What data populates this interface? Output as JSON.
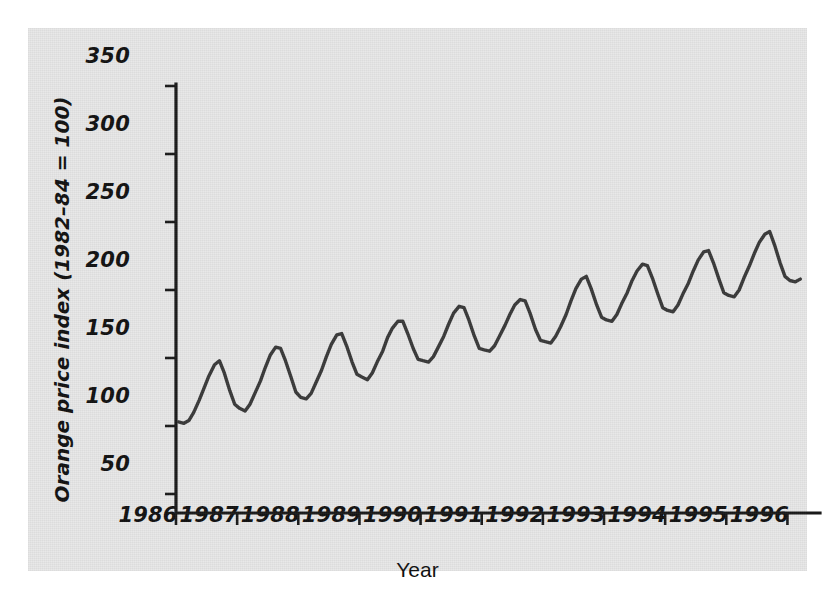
{
  "figure": {
    "background_color": "#e8e8e8",
    "page_color": "#ffffff",
    "line_color": "#3a3a3a",
    "axis_color": "#1a1a1a"
  },
  "chart_data": {
    "type": "line",
    "title": "",
    "subtitle": "",
    "xlabel": "Year",
    "ylabel": "Orange price index (1982–84 = 100)",
    "xlim": [
      1986.0,
      1996.5
    ],
    "ylim": [
      50,
      360
    ],
    "xticks": [
      1986,
      1987,
      1988,
      1989,
      1990,
      1991,
      1992,
      1993,
      1994,
      1995,
      1996
    ],
    "xticklabels": [
      "1986",
      "1987",
      "1988",
      "1989",
      "1990",
      "1991",
      "1992",
      "1993",
      "1994",
      "1995",
      "1996"
    ],
    "yticks": [
      50,
      100,
      150,
      200,
      250,
      300,
      350
    ],
    "yticklabels": [
      "50",
      "100",
      "150",
      "200",
      "250",
      "300",
      "350"
    ],
    "grid": false,
    "legend": null,
    "legend_position": "none",
    "annotations": [],
    "series": [
      {
        "name": "Orange price index",
        "color": "#3a3a3a",
        "x": [
          1986.04,
          1986.13,
          1986.21,
          1986.29,
          1986.38,
          1986.46,
          1986.54,
          1986.63,
          1986.71,
          1986.79,
          1986.88,
          1986.96,
          1987.04,
          1987.13,
          1987.21,
          1987.29,
          1987.38,
          1987.46,
          1987.54,
          1987.63,
          1987.71,
          1987.79,
          1987.88,
          1987.96,
          1988.04,
          1988.13,
          1988.21,
          1988.29,
          1988.38,
          1988.46,
          1988.54,
          1988.63,
          1988.71,
          1988.79,
          1988.88,
          1988.96,
          1989.04,
          1989.13,
          1989.21,
          1989.29,
          1989.38,
          1989.46,
          1989.54,
          1989.63,
          1989.71,
          1989.79,
          1989.88,
          1989.96,
          1990.04,
          1990.13,
          1990.21,
          1990.29,
          1990.38,
          1990.46,
          1990.54,
          1990.63,
          1990.71,
          1990.79,
          1990.88,
          1990.96,
          1991.04,
          1991.13,
          1991.21,
          1991.29,
          1991.38,
          1991.46,
          1991.54,
          1991.63,
          1991.71,
          1991.79,
          1991.88,
          1991.96,
          1992.04,
          1992.13,
          1992.21,
          1992.29,
          1992.38,
          1992.46,
          1992.54,
          1992.63,
          1992.71,
          1992.79,
          1992.88,
          1992.96,
          1993.04,
          1993.13,
          1993.21,
          1993.29,
          1993.38,
          1993.46,
          1993.54,
          1993.63,
          1993.71,
          1993.79,
          1993.88,
          1993.96,
          1994.04,
          1994.13,
          1994.21,
          1994.29,
          1994.38,
          1994.46,
          1994.54,
          1994.63,
          1994.71,
          1994.79,
          1994.88,
          1994.96,
          1995.04,
          1995.13,
          1995.21,
          1995.29,
          1995.38,
          1995.46,
          1995.54,
          1995.63,
          1995.71,
          1995.79,
          1995.88,
          1995.96,
          1996.04,
          1996.13,
          1996.21
        ],
        "y": [
          103,
          102,
          104,
          110,
          119,
          128,
          137,
          145,
          148,
          139,
          126,
          116,
          113,
          111,
          116,
          124,
          133,
          143,
          152,
          158,
          157,
          148,
          136,
          125,
          121,
          120,
          124,
          132,
          141,
          151,
          160,
          167,
          168,
          159,
          147,
          138,
          136,
          134,
          139,
          147,
          155,
          165,
          172,
          177,
          177,
          168,
          157,
          149,
          148,
          147,
          151,
          158,
          166,
          175,
          183,
          188,
          187,
          178,
          166,
          157,
          156,
          155,
          159,
          166,
          174,
          182,
          189,
          193,
          192,
          183,
          171,
          163,
          162,
          161,
          166,
          173,
          182,
          192,
          201,
          208,
          210,
          201,
          189,
          180,
          178,
          177,
          182,
          190,
          198,
          207,
          214,
          219,
          218,
          209,
          197,
          187,
          185,
          184,
          189,
          197,
          205,
          214,
          222,
          228,
          229,
          220,
          208,
          198,
          196,
          195,
          200,
          209,
          218,
          227,
          235,
          241,
          243,
          233,
          220,
          210,
          207,
          206,
          208
        ]
      }
    ]
  }
}
